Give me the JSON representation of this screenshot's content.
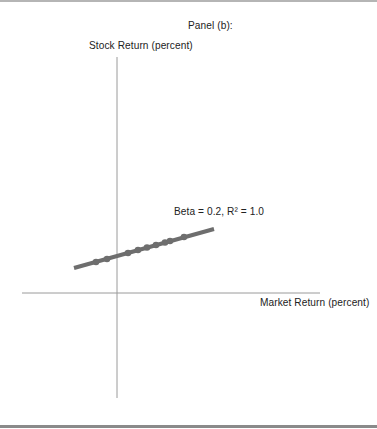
{
  "panel": {
    "title": "Panel (b):"
  },
  "axes": {
    "y_label": "Stock Return (percent)",
    "x_label": "Market Return (percent)"
  },
  "annotation": {
    "text": "Beta = 0.2, R² = 1.0"
  },
  "colors": {
    "line": "#6e6e6e",
    "points": "#6e6e6e",
    "axis": "#9a9a9a",
    "text": "#222222"
  },
  "chart_data": {
    "type": "scatter",
    "title": "Panel (b):",
    "xlabel": "Market Return (percent)",
    "ylabel": "Stock Return (percent)",
    "grid": false,
    "legend": null,
    "annotations": [
      "Beta = 0.2, R² = 1.0"
    ],
    "fit_line": {
      "slope": 0.2,
      "r_squared": 1.0,
      "pixel_start": [
        74,
        268
      ],
      "pixel_end": [
        214,
        229
      ]
    },
    "points_pixel": [
      [
        96,
        262
      ],
      [
        107,
        259
      ],
      [
        128,
        253
      ],
      [
        138,
        250
      ],
      [
        147,
        247.5
      ],
      [
        156,
        245
      ],
      [
        165,
        242.5
      ],
      [
        170,
        241
      ],
      [
        184,
        237
      ]
    ],
    "origin_pixel": [
      117,
      293
    ],
    "x_axis_pixel_range": [
      22,
      320
    ],
    "y_axis_pixel_range": [
      57,
      398
    ],
    "series": [
      {
        "name": "observations",
        "note": "units not labeled; positions relative to origin in pixels",
        "x": [
          -21,
          -10,
          11,
          21,
          30,
          39,
          48,
          53,
          67
        ],
        "y": [
          31,
          34,
          40,
          43,
          45.5,
          48,
          50.5,
          52,
          56
        ]
      }
    ]
  }
}
